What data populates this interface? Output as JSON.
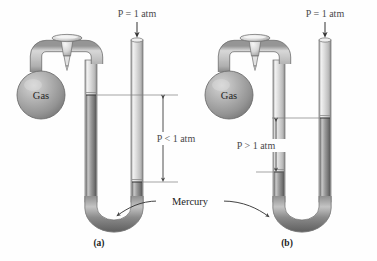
{
  "figure": {
    "type": "manometer-diagram",
    "background": "#fefefe",
    "ink": "#1d1d1d",
    "label_color": "#4a4a4a",
    "glass_color": "#d8d8d8",
    "glass_light": "#f4f4f4",
    "glass_dark": "#9a9a9a",
    "mercury_color": "#8e8e8e",
    "mercury_dark": "#6a6a6a",
    "bulb_color": "#a9a9a9"
  },
  "shared": {
    "mercury_label": "Mercury",
    "gas_label": "Gas",
    "atm_label": "P = 1 atm"
  },
  "panels": [
    {
      "id": "a",
      "caption": "(a)",
      "gas_label": "Gas",
      "atm_label": "P = 1 atm",
      "pressure_label": "P < 1 atm",
      "pressure_relation": "less-than",
      "closed_arm_mercury_top_y": 95,
      "open_arm_mercury_top_y": 182,
      "height_difference_px": 87,
      "origin_x": 0
    },
    {
      "id": "b",
      "caption": "(b)",
      "gas_label": "Gas",
      "atm_label": "P = 1 atm",
      "pressure_label": "P > 1 atm",
      "pressure_relation": "greater-than",
      "closed_arm_mercury_top_y": 172,
      "open_arm_mercury_top_y": 118,
      "height_difference_px": 54,
      "origin_x": 188
    }
  ],
  "icons": {
    "down_arrow": "atmosphere-arrow",
    "double_arrow": "height-dimension-arrow",
    "leader": "mercury-leader-arrow"
  }
}
